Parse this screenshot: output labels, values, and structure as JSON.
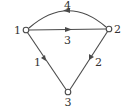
{
  "diagram": {
    "type": "directed-graph",
    "nodes": [
      {
        "id": "1",
        "label": "1",
        "x": 26,
        "y": 30,
        "label_x": 15,
        "label_y": 34
      },
      {
        "id": "2",
        "label": "2",
        "x": 109,
        "y": 29,
        "label_x": 114,
        "label_y": 33
      },
      {
        "id": "3",
        "label": "3",
        "x": 68,
        "y": 92,
        "label_x": 64,
        "label_y": 106
      }
    ],
    "edges": [
      {
        "from": "1",
        "to": "2",
        "label": "3",
        "shape": "straight"
      },
      {
        "from": "2",
        "to": "1",
        "label": "4",
        "shape": "arc-above"
      },
      {
        "from": "1",
        "to": "3",
        "label": "1",
        "shape": "straight"
      },
      {
        "from": "2",
        "to": "3",
        "label": "2",
        "shape": "straight"
      }
    ],
    "colors": {
      "stroke": "#4a4a4a",
      "text": "#333333",
      "background": "#ffffff"
    }
  }
}
